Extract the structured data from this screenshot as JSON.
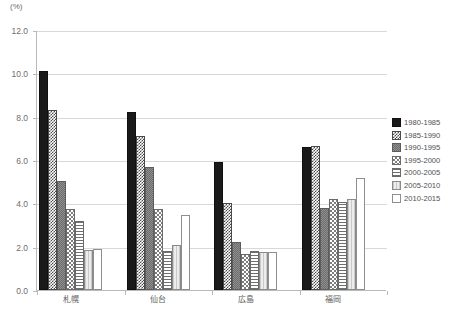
{
  "chart_data": {
    "type": "bar",
    "title": "",
    "xlabel": "",
    "ylabel": "(%)",
    "ylim": [
      0,
      12
    ],
    "ytick_step": 2,
    "ytick_labels": [
      "0.0",
      "2.0",
      "4.0",
      "6.0",
      "8.0",
      "10.0",
      "12.0"
    ],
    "grid": true,
    "legend_position": "right",
    "categories": [
      "札幌",
      "仙台",
      "広島",
      "福岡"
    ],
    "series": [
      {
        "name": "1980-1985",
        "values": [
          10.1,
          8.2,
          5.9,
          6.6
        ]
      },
      {
        "name": "1985-1990",
        "values": [
          8.3,
          7.1,
          4.0,
          6.65
        ]
      },
      {
        "name": "1990-1995",
        "values": [
          5.05,
          5.7,
          2.2,
          3.8
        ]
      },
      {
        "name": "1995-2000",
        "values": [
          3.75,
          3.75,
          1.65,
          4.2
        ]
      },
      {
        "name": "2000-2005",
        "values": [
          3.2,
          1.8,
          1.8,
          4.05
        ]
      },
      {
        "name": "2005-2010",
        "values": [
          1.85,
          2.1,
          1.75,
          4.2
        ]
      },
      {
        "name": "2010-2015",
        "values": [
          1.9,
          3.45,
          1.75,
          5.15
        ]
      }
    ]
  },
  "axis": {
    "unit_label": "(%)"
  },
  "caption": ""
}
